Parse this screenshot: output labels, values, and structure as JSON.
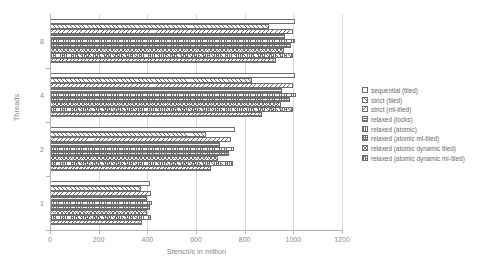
{
  "chart_data": {
    "type": "bar",
    "orientation": "horizontal",
    "title": "",
    "xlabel": "Stencil/s in million",
    "ylabel": "Threads",
    "categories": [
      "1",
      "2",
      "4",
      "8"
    ],
    "xlim": [
      0,
      1200
    ],
    "xticks": [
      0,
      200,
      400,
      600,
      800,
      1000,
      1200
    ],
    "grid": true,
    "legend_position": "right",
    "series": [
      {
        "name": "sequential (tiled)",
        "values": [
          410,
          760,
          1005,
          1005
        ]
      },
      {
        "name": "strict (tiled)",
        "values": [
          375,
          640,
          830,
          900
        ]
      },
      {
        "name": "strict (ml-tiled)",
        "values": [
          415,
          745,
          1000,
          1000
        ]
      },
      {
        "name": "relaxed (locks)",
        "values": [
          400,
          700,
          955,
          965
        ]
      },
      {
        "name": "relaxed (atomic)",
        "values": [
          418,
          755,
          1010,
          1008
        ]
      },
      {
        "name": "relaxed (atomic ml-tiled)",
        "values": [
          412,
          735,
          985,
          990
        ]
      },
      {
        "name": "relaxed (atomic dynamic tiled)",
        "values": [
          398,
          690,
          950,
          960
        ]
      },
      {
        "name": "relaxed (atomic dynamic ml-tiled)",
        "values": [
          414,
          750,
          1000,
          998
        ]
      },
      {
        "name": "relaxed (atomic dynamic)",
        "values": [
          380,
          660,
          870,
          930
        ]
      }
    ]
  },
  "axes": {
    "x_title": "Stencil/s in million",
    "y_title": "Threads",
    "x_tick_labels": [
      "0",
      "200",
      "400",
      "600",
      "800",
      "1000",
      "1200"
    ],
    "y_tick_labels": [
      "1",
      "2",
      "4",
      "8"
    ]
  },
  "legend": {
    "items": [
      "sequential (tiled)",
      "strict (tiled)",
      "strict (ml-tiled)",
      "relaxed (locks)",
      "relaxed (atomic)",
      "relaxed (atomic ml-tiled)",
      "relaxed (atomic dynamic tiled)",
      "relaxed (atomic dynamic ml-tiled)"
    ]
  },
  "colors": {
    "background": "#ffffff",
    "grid": "#d9d9d9",
    "axis": "#b3b3b3",
    "text": "#8c8c8c",
    "bar_outline": "#6e6e6e",
    "bar_hatch": "#707070"
  }
}
